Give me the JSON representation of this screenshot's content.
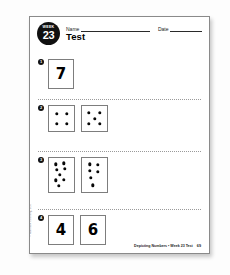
{
  "page": {
    "badge": {
      "week_label": "Week",
      "week_number": "23"
    },
    "name_label": "Name",
    "date_label": "Date",
    "title": "Test",
    "footer_title": "Depicting Numbers • Week 23 Test",
    "footer_page": "69",
    "side_credit": "© Newmark Learning, LLC"
  },
  "problems": [
    {
      "number": "1",
      "cards": [
        {
          "kind": "numeral",
          "value": "7"
        }
      ]
    },
    {
      "number": "2",
      "cards": [
        {
          "kind": "dots",
          "value": "4",
          "size": "small",
          "dots": [
            [
              30,
              30
            ],
            [
              70,
              30
            ],
            [
              30,
              70
            ],
            [
              70,
              70
            ]
          ]
        },
        {
          "kind": "dots",
          "value": "5",
          "size": "small",
          "dots": [
            [
              28,
              28
            ],
            [
              72,
              28
            ],
            [
              50,
              50
            ],
            [
              28,
              72
            ],
            [
              72,
              72
            ]
          ]
        }
      ]
    },
    {
      "number": "3",
      "cards": [
        {
          "kind": "dots",
          "value": "8",
          "size": "tall",
          "dots": [
            [
              26,
              18
            ],
            [
              58,
              16
            ],
            [
              30,
              34
            ],
            [
              62,
              32
            ],
            [
              44,
              50
            ],
            [
              26,
              66
            ],
            [
              60,
              64
            ],
            [
              40,
              82
            ]
          ]
        },
        {
          "kind": "dots",
          "value": "6",
          "size": "tall",
          "dots": [
            [
              30,
              18
            ],
            [
              64,
              20
            ],
            [
              30,
              38
            ],
            [
              62,
              40
            ],
            [
              34,
              58
            ],
            [
              44,
              80
            ]
          ]
        }
      ]
    },
    {
      "number": "4",
      "cards": [
        {
          "kind": "numeral",
          "value": "4"
        },
        {
          "kind": "numeral",
          "value": "6"
        }
      ]
    }
  ]
}
